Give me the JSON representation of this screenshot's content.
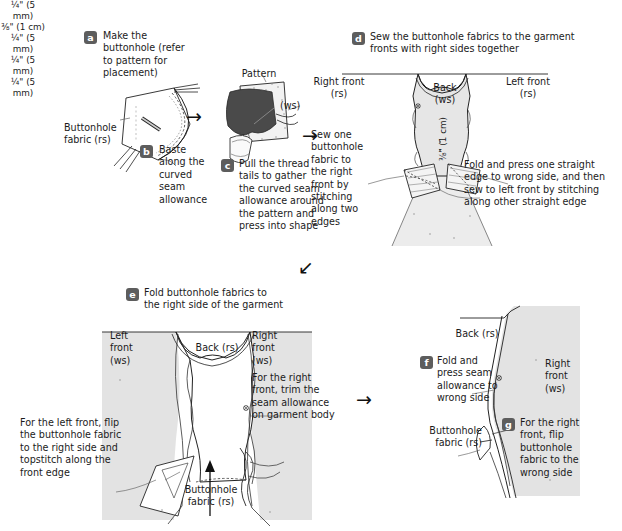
{
  "document": {
    "title": "Buttonhole fabric construction steps",
    "type": "sewing-instruction-diagram"
  },
  "colors": {
    "badge_bg": "#5d5d5d",
    "badge_text": "#ffffff",
    "text": "#1b1b1b",
    "garment_fill": "#e3e3e3",
    "garment_fill_light": "#efefef",
    "pattern_dark": "#4a4a4a",
    "line": "#222222"
  },
  "steps": {
    "a": {
      "letter": "a",
      "text": "Make the\nbuttonhole (refer\nto pattern for\nplacement)"
    },
    "b": {
      "letter": "b",
      "text": "Baste\nalong the\ncurved\nseam\nallowance"
    },
    "c": {
      "letter": "c",
      "text": "Pull the thread\ntails to gather\nthe curved seam\nallowance around\nthe pattern and\npress into shape"
    },
    "d": {
      "letter": "d",
      "text": "Sew the buttonhole fabrics to the garment\nfronts with right sides together"
    },
    "e": {
      "letter": "e",
      "text": "Fold buttonhole fabrics to\nthe right side of the garment"
    },
    "f": {
      "letter": "f",
      "text": "Fold and\npress seam\nallowance to\nwrong side"
    },
    "g": {
      "letter": "g",
      "text": "For the right\nfront, flip\nbuttonhole\nfabric to the\nwrong side"
    }
  },
  "labels": {
    "buttonhole_fabric_rs_1": "Buttonhole\nfabric (rs)",
    "pattern": "Pattern",
    "ws_1": "(ws)",
    "meas_5mm_c": "¼\"\n(5 mm)",
    "right_front_rs": "Right front\n(rs)",
    "left_front_rs": "Left front\n(rs)",
    "back_ws": "Back\n(ws)",
    "meas_1cm_vertical": "⅜\" (1 cm)",
    "meas_1cm_bottom": "⅜\"\n(1 cm)",
    "sew_one_buttonhole": "Sew one\nbuttonhole\nfabric to\nthe right\nfront by\nstitching\nalong two\nedges",
    "fold_and_press_one": "Fold and press one straight\nedge to wrong side, and then\nsew to left front by stitching\nalong other straight edge",
    "left_front_ws": "Left\nfront\n(ws)",
    "back_rs_e": "Back (rs)",
    "right_front_ws_e": "Right\nfront\n(ws)",
    "meas_5mm_e1": "¼\"\n(5 mm)",
    "meas_5mm_e2": "¼\"\n(5 mm)",
    "meas_5mm_e3": "¼\"\n(5 mm)",
    "trim_seam_allowance": "For the right\nfront, trim the\nseam allowance\non garment body",
    "flip_left_front": "For the left front, flip\nthe buttonhole fabric\nto the right side and\ntopstitch along the\nfront edge",
    "buttonhole_fabric_rs_e": "Buttonhole\nfabric (rs)",
    "back_rs_f": "Back (rs)",
    "right_front_ws_f": "Right\nfront\n(ws)",
    "buttonhole_fabric_rs_f": "Buttonhole\nfabric (rs)"
  },
  "arrows": {
    "arrow_a_to_c": "→",
    "arrow_c_to_d": "→",
    "arrow_d_to_e": "↙",
    "arrow_e_to_f": "→"
  }
}
